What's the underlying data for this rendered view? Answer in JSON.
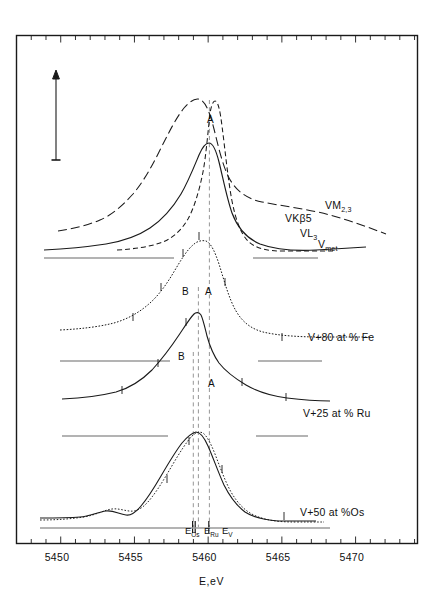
{
  "figure": {
    "axis_title": "E,eV",
    "x_axis": {
      "label": "E,eV",
      "min": 5447.0,
      "max": 5474.2,
      "major_ticks": [
        5450,
        5455,
        5460,
        5465,
        5470
      ],
      "major_tick_labels": [
        "5450",
        "5455",
        "5460",
        "5465",
        "5470"
      ],
      "minor_tick_step": 1
    },
    "y_axis": {
      "label": "",
      "arrow": "intensity-arrow-up",
      "ticks_shown": false
    },
    "energy_markers": [
      {
        "name": "E-Os",
        "label_main": "E",
        "label_sub": "Os",
        "value": 5460.85
      },
      {
        "name": "E-Ru",
        "label_main": "E",
        "label_sub": "Ru",
        "value": 5461.25
      },
      {
        "name": "E-V",
        "label_main": "E",
        "label_sub": "V",
        "value": 5462.1
      }
    ],
    "curve_labels": [
      {
        "name": "VM23",
        "main": "VM",
        "sub": "2,3",
        "x": 325,
        "y": 199
      },
      {
        "name": "VKbeta5",
        "main": "VKβ5",
        "sub": "",
        "x": 285,
        "y": 212
      },
      {
        "name": "VL3",
        "main": "VL",
        "sub": "3",
        "x": 300,
        "y": 227
      },
      {
        "name": "Vmet",
        "main": "V",
        "sub": "met",
        "x": 318,
        "y": 238
      }
    ],
    "sample_labels": [
      {
        "name": "sample-fe",
        "text": "V+80 at % Fe",
        "x": 308,
        "y": 331
      },
      {
        "name": "sample-ru",
        "text": "V+25 at % Ru",
        "x": 303,
        "y": 407
      },
      {
        "name": "sample-os",
        "text": "V+50 at %Os",
        "x": 300,
        "y": 506
      }
    ],
    "peak_labels": [
      {
        "name": "peak-A-top",
        "text": "A",
        "x": 207,
        "y": 114
      },
      {
        "name": "peak-B-fe",
        "text": "B",
        "x": 182,
        "y": 286
      },
      {
        "name": "peak-A-fe",
        "text": "A",
        "x": 205,
        "y": 286
      },
      {
        "name": "peak-B-ru",
        "text": "B",
        "x": 178,
        "y": 351
      },
      {
        "name": "peak-A-ru",
        "text": "A",
        "x": 208,
        "y": 378
      }
    ]
  },
  "chart_data": {
    "type": "line",
    "title": "",
    "xlabel": "E,eV",
    "ylabel": "Intensity (arb. units)",
    "xlim": [
      5447.0,
      5474.2
    ],
    "grid": false,
    "legend": "inline-right-of-curves",
    "vertical_reference_lines": [
      {
        "name": "E-Os",
        "value": 5460.85,
        "style": "dashed"
      },
      {
        "name": "E-Ru",
        "value": 5461.25,
        "style": "dashed"
      },
      {
        "name": "E-V",
        "value": 5462.1,
        "style": "dashed"
      }
    ],
    "series": [
      {
        "name": "VM2,3",
        "label": "VM2,3",
        "style": "long-dashed",
        "group": "V-metal-reference",
        "peak_eV": 5461.4,
        "x": [
          5450.5,
          5452,
          5453.5,
          5455,
          5456.5,
          5458,
          5459,
          5460,
          5460.8,
          5461.4,
          5462,
          5462.8,
          5463.8,
          5465,
          5466.5,
          5468,
          5470,
          5472,
          5473.5
        ],
        "y": [
          0.08,
          0.11,
          0.16,
          0.23,
          0.34,
          0.52,
          0.66,
          0.85,
          0.96,
          1.0,
          0.95,
          0.78,
          0.6,
          0.48,
          0.4,
          0.35,
          0.29,
          0.24,
          0.21
        ]
      },
      {
        "name": "VKbeta5",
        "label": "VKβ5",
        "style": "dashed",
        "group": "V-metal-reference",
        "peak_eV": 5462.0,
        "x": [
          5453.5,
          5455,
          5456.5,
          5458,
          5459,
          5460,
          5461,
          5461.6,
          5462,
          5462.5,
          5463,
          5463.6,
          5464.2,
          5465,
          5466,
          5467.5,
          5469,
          5471,
          5473
        ],
        "y": [
          0.04,
          0.07,
          0.11,
          0.18,
          0.28,
          0.45,
          0.74,
          0.92,
          0.98,
          0.94,
          0.8,
          0.58,
          0.37,
          0.22,
          0.13,
          0.08,
          0.06,
          0.05,
          0.04
        ]
      },
      {
        "name": "VL3",
        "label": "VL3",
        "style": "solid",
        "group": "V-metal-reference",
        "peak_eV": 5461.6,
        "x": [
          5448.2,
          5450,
          5452,
          5454,
          5455.5,
          5457,
          5458.5,
          5459.5,
          5460.5,
          5461.2,
          5461.7,
          5462.3,
          5463,
          5463.8,
          5464.6,
          5465.6,
          5467,
          5469,
          5471,
          5473
        ],
        "y": [
          0.03,
          0.04,
          0.055,
          0.08,
          0.11,
          0.16,
          0.26,
          0.4,
          0.62,
          0.78,
          0.82,
          0.76,
          0.58,
          0.38,
          0.24,
          0.15,
          0.1,
          0.07,
          0.06,
          0.055
        ]
      },
      {
        "name": "Vmet",
        "label": "Vmet",
        "style": "baseline",
        "group": "V-metal-reference"
      },
      {
        "name": "V+80 at % Fe",
        "label": "V+80 at % Fe",
        "style": "dotted-with-points",
        "peaks": [
          {
            "label": "B",
            "eV": 5460.9
          },
          {
            "label": "A",
            "eV": 5462.1
          }
        ],
        "x": [
          5448,
          5450,
          5452,
          5453.5,
          5455,
          5456.2,
          5457.2,
          5458,
          5458.8,
          5459.6,
          5460.3,
          5460.9,
          5461.5,
          5462.1,
          5462.7,
          5463.4,
          5464.2,
          5465,
          5466,
          5467.5,
          5469,
          5471,
          5473
        ],
        "y": [
          0.04,
          0.05,
          0.07,
          0.1,
          0.16,
          0.24,
          0.33,
          0.44,
          0.58,
          0.74,
          0.88,
          0.96,
          0.98,
          1.0,
          0.94,
          0.8,
          0.58,
          0.38,
          0.24,
          0.15,
          0.11,
          0.09,
          0.08
        ]
      },
      {
        "name": "V+25 at % Ru",
        "label": "V+25 at % Ru",
        "style": "solid-with-ticks",
        "peaks": [
          {
            "label": "B",
            "eV": 5460.9
          },
          {
            "label": "A",
            "eV": 5462.1
          }
        ],
        "x": [
          5448,
          5450,
          5452,
          5453.5,
          5455,
          5456.3,
          5457.4,
          5458.3,
          5459.2,
          5460,
          5460.6,
          5461,
          5461.5,
          5462,
          5462.6,
          5463.3,
          5464,
          5464.8,
          5465.8,
          5467,
          5468.5,
          5470.5,
          5472.5
        ],
        "y": [
          0.05,
          0.06,
          0.08,
          0.11,
          0.17,
          0.25,
          0.36,
          0.49,
          0.64,
          0.8,
          0.92,
          0.96,
          0.9,
          0.84,
          0.78,
          0.66,
          0.48,
          0.32,
          0.21,
          0.14,
          0.1,
          0.08,
          0.07
        ]
      },
      {
        "name": "V+50 at %Os",
        "label": "V+50 at %Os",
        "style": "solid-and-dotted-overlay",
        "peaks": [
          {
            "label": "B",
            "eV": 5460.9
          }
        ],
        "x": [
          5447.5,
          5449,
          5450.5,
          5452,
          5453,
          5453.8,
          5454.6,
          5455.5,
          5456.5,
          5457.5,
          5458.4,
          5459.3,
          5460.1,
          5460.9,
          5461.6,
          5462.3,
          5463,
          5463.8,
          5464.6,
          5465.6,
          5466.8,
          5468.4,
          5470,
          5472
        ],
        "y": [
          0.03,
          0.045,
          0.06,
          0.075,
          0.085,
          0.07,
          0.09,
          0.13,
          0.19,
          0.28,
          0.4,
          0.56,
          0.76,
          0.92,
          0.88,
          0.74,
          0.56,
          0.38,
          0.24,
          0.14,
          0.08,
          0.05,
          0.04,
          0.035
        ]
      }
    ]
  }
}
